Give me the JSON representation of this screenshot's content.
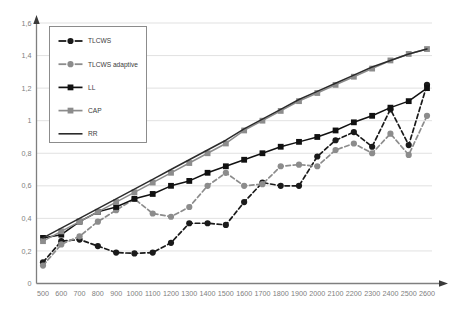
{
  "chart_data": {
    "type": "line",
    "title": "",
    "xlabel": "",
    "ylabel": "",
    "xlim": [
      500,
      2600
    ],
    "ylim": [
      0,
      1.6
    ],
    "ytick_step": 0.2,
    "grid": true,
    "decimal_separator": ",",
    "legend_position": "top-left-inside",
    "categories": [
      500,
      600,
      700,
      800,
      900,
      1000,
      1100,
      1200,
      1300,
      1400,
      1500,
      1600,
      1700,
      1800,
      1900,
      2000,
      2100,
      2200,
      2300,
      2400,
      2500,
      2600
    ],
    "xtick_labels": [
      "500",
      "600",
      "700",
      "800",
      "900",
      "1000",
      "1100",
      "1200",
      "1300",
      "1400",
      "1500",
      "1600",
      "1700",
      "1800",
      "1900",
      "2000",
      "2100",
      "2200",
      "2300",
      "2400",
      "2500",
      "2600"
    ],
    "ytick_labels": [
      "0",
      "0,2",
      "0,4",
      "0,6",
      "0,8",
      "1",
      "1,2",
      "1,4",
      "1,6"
    ],
    "ytick_values": [
      0,
      0.2,
      0.4,
      0.6,
      0.8,
      1.0,
      1.2,
      1.4,
      1.6
    ],
    "series": [
      {
        "name": "TLCWS",
        "color": "#1a1a1a",
        "style": "dashed",
        "marker": "circle",
        "values": [
          0.13,
          0.26,
          0.27,
          0.23,
          0.19,
          0.185,
          0.19,
          0.25,
          0.37,
          0.37,
          0.36,
          0.5,
          0.62,
          0.6,
          0.6,
          0.78,
          0.88,
          0.93,
          0.84,
          1.07,
          0.85,
          1.22
        ]
      },
      {
        "name": "TLCWS adaptive",
        "color": "#8c8c8c",
        "style": "dashed",
        "marker": "circle",
        "values": [
          0.11,
          0.24,
          0.29,
          0.38,
          0.45,
          0.52,
          0.43,
          0.41,
          0.47,
          0.6,
          0.68,
          0.6,
          0.61,
          0.72,
          0.73,
          0.72,
          0.82,
          0.86,
          0.8,
          0.92,
          0.79,
          1.03
        ]
      },
      {
        "name": "LL",
        "color": "#111111",
        "style": "solid",
        "marker": "square",
        "values": [
          0.28,
          0.3,
          0.38,
          0.44,
          0.47,
          0.52,
          0.55,
          0.6,
          0.63,
          0.68,
          0.72,
          0.76,
          0.8,
          0.84,
          0.87,
          0.9,
          0.94,
          0.99,
          1.03,
          1.08,
          1.12,
          1.2
        ]
      },
      {
        "name": "CAP",
        "color": "#8c8c8c",
        "style": "solid",
        "marker": "square",
        "values": [
          0.26,
          0.32,
          0.38,
          0.44,
          0.5,
          0.56,
          0.62,
          0.68,
          0.74,
          0.8,
          0.86,
          0.94,
          1.0,
          1.06,
          1.12,
          1.17,
          1.22,
          1.27,
          1.32,
          1.37,
          1.41,
          1.44
        ]
      },
      {
        "name": "RR",
        "color": "#2b2b2b",
        "style": "solid",
        "marker": "none",
        "values": [
          0.28,
          0.34,
          0.4,
          0.46,
          0.52,
          0.58,
          0.64,
          0.7,
          0.76,
          0.82,
          0.88,
          0.95,
          1.01,
          1.07,
          1.13,
          1.18,
          1.23,
          1.28,
          1.33,
          1.37,
          1.41,
          1.44
        ]
      }
    ],
    "legend": [
      {
        "label": "TLCWS",
        "color": "#1a1a1a",
        "style": "dashed",
        "marker": "circle"
      },
      {
        "label": "TLCWS adaptive",
        "color": "#8c8c8c",
        "style": "dashed",
        "marker": "circle"
      },
      {
        "label": "LL",
        "color": "#111111",
        "style": "solid",
        "marker": "square"
      },
      {
        "label": "CAP",
        "color": "#8c8c8c",
        "style": "solid",
        "marker": "square"
      },
      {
        "label": "RR",
        "color": "#2b2b2b",
        "style": "solid",
        "marker": "none"
      }
    ]
  },
  "axes": {
    "y_axis_name": "value-axis",
    "x_axis_name": "category-axis"
  }
}
